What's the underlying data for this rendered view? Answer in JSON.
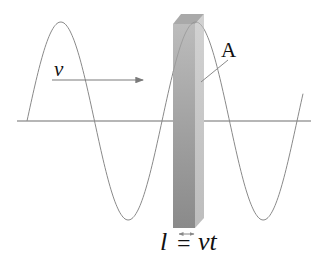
{
  "diagram": {
    "labels": {
      "velocity": "v",
      "area": "A",
      "length_symbol": "l",
      "equals": "=",
      "length_expr": "vt"
    },
    "colors": {
      "wave": "#8a8a8a",
      "axis": "#6e6e6e",
      "arrow": "#7a7a7a",
      "bar_front_light": "#b8b8b8",
      "bar_front_dark": "#8c8c8c",
      "bar_side": "#c8c8c8",
      "bar_top": "#a9a9a9",
      "text": "#111111"
    },
    "geometry": {
      "axis_y": 121,
      "axis_x_start": 17,
      "axis_x_end": 311,
      "wave_amplitude": 99,
      "wave_wavelength": 135,
      "wave_x_start": 27,
      "wave_x_end": 303
    }
  }
}
